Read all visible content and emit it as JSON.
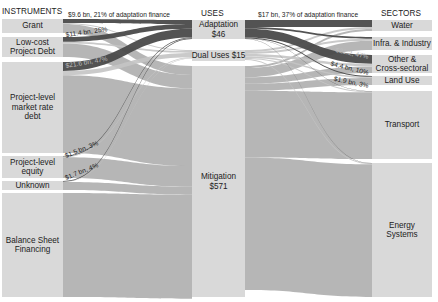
{
  "headers": {
    "instruments": "INSTRUMENTS",
    "uses": "USES",
    "sectors": "SECTORS"
  },
  "instruments": [
    {
      "label": "Grant",
      "y0": 19,
      "y1": 33
    },
    {
      "label": "Low-cost Project Debt",
      "lines": [
        "Low-cost",
        "Project Debt"
      ],
      "y0": 37,
      "y1": 57
    },
    {
      "label": "Project-level market rate debt",
      "lines": [
        "Project-level",
        "market rate",
        "debt"
      ],
      "y0": 62,
      "y1": 153
    },
    {
      "label": "Project-level equity",
      "lines": [
        "Project-level",
        "equity"
      ],
      "y0": 156,
      "y1": 178
    },
    {
      "label": "Unknown",
      "y0": 181,
      "y1": 190
    },
    {
      "label": "Balance Sheet Financing",
      "lines": [
        "Balance Sheet",
        "Financing"
      ],
      "y0": 193,
      "y1": 297
    }
  ],
  "uses": [
    {
      "label": "Adaptation",
      "value": "$46",
      "y0": 20,
      "y1": 39
    },
    {
      "label": "Dual Uses",
      "value": "$15",
      "y0": 50,
      "y1": 61
    },
    {
      "label": "Mitigation",
      "value": "$571",
      "y0": 66,
      "y1": 297
    }
  ],
  "sectors": [
    {
      "label": "Water",
      "y0": 20,
      "y1": 31
    },
    {
      "label": "Infra. & Industry",
      "y0": 37,
      "y1": 50
    },
    {
      "label": "Other & Cross-sectoral",
      "lines": [
        "Other &",
        "Cross-sectoral"
      ],
      "y0": 55,
      "y1": 73
    },
    {
      "label": "Land Use",
      "y0": 76,
      "y1": 85
    },
    {
      "label": "Transport",
      "y0": 91,
      "y1": 159
    },
    {
      "label": "Energy Systems",
      "lines": [
        "Energy",
        "Systems"
      ],
      "y0": 163,
      "y1": 297
    }
  ],
  "annotations": {
    "grant_adaptation": "$9.6 bn, 21% of adaptation finance",
    "lowcost_adaptation": "$11.4 bn, 25%",
    "marketdebt_adaptation": "$21.6 bn, 47%",
    "equity_adaptation": "$1.5 bn, 3%",
    "unknown_adaptation": "$1.7 bn, 4%",
    "adaptation_water": "$17 bn, 37% of adaptation finance",
    "adaptation_other": "$21.2, 47%",
    "adaptation_infra": "$4.4 bn, 10%",
    "adaptation_landuse": "$1.9 bn, 3%"
  },
  "colors": {
    "node_fill": "#d9d9d9",
    "flow_mitigation": "#a9a9a9",
    "flow_adaptation": "#4a4a4a",
    "flow_dual": "#c4c4c4",
    "background": "#ffffff",
    "text": "#222222"
  },
  "chart_data": {
    "type": "sankey",
    "title": "",
    "units": "USD bn",
    "columns": [
      "INSTRUMENTS",
      "USES",
      "SECTORS"
    ],
    "nodes": {
      "instruments": [
        "Grant",
        "Low-cost Project Debt",
        "Project-level market rate debt",
        "Project-level equity",
        "Unknown",
        "Balance Sheet Financing"
      ],
      "uses": [
        {
          "name": "Adaptation",
          "value": 46
        },
        {
          "name": "Dual Uses",
          "value": 15
        },
        {
          "name": "Mitigation",
          "value": 571
        }
      ],
      "sectors": [
        "Water",
        "Infra. & Industry",
        "Other & Cross-sectoral",
        "Land Use",
        "Transport",
        "Energy Systems"
      ]
    },
    "highlighted_flows": [
      {
        "source": "Grant",
        "target": "Adaptation",
        "value": 9.6,
        "share": "21%"
      },
      {
        "source": "Low-cost Project Debt",
        "target": "Adaptation",
        "value": 11.4,
        "share": "25%"
      },
      {
        "source": "Project-level market rate debt",
        "target": "Adaptation",
        "value": 21.6,
        "share": "47%"
      },
      {
        "source": "Project-level equity",
        "target": "Adaptation",
        "value": 1.5,
        "share": "3%"
      },
      {
        "source": "Unknown",
        "target": "Adaptation",
        "value": 1.7,
        "share": "4%"
      },
      {
        "source": "Adaptation",
        "target": "Water",
        "value": 17,
        "share": "37%"
      },
      {
        "source": "Adaptation",
        "target": "Other & Cross-sectoral",
        "value": 21.2,
        "share": "47%"
      },
      {
        "source": "Adaptation",
        "target": "Infra. & Industry",
        "value": 4.4,
        "share": "10%"
      },
      {
        "source": "Adaptation",
        "target": "Land Use",
        "value": 1.9,
        "share": "3%"
      }
    ]
  }
}
